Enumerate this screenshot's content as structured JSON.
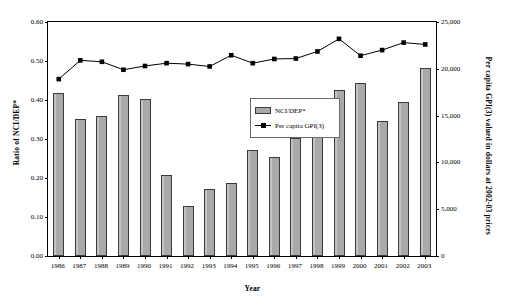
{
  "chart_data": {
    "type": "bar",
    "title": "",
    "xlabel": "Year",
    "ylabel": "Ratio of NCI/DEP*",
    "y2label": "Per capita GPI(3) valued in dollars at 2002-03 prices",
    "grid": false,
    "legend_position": "inside-center",
    "categories": [
      "1986",
      "1987",
      "1988",
      "1989",
      "1990",
      "1991",
      "1992",
      "1993",
      "1994",
      "1995",
      "1996",
      "1997",
      "1998",
      "1999",
      "2000",
      "2001",
      "2002",
      "2003"
    ],
    "ylim": [
      0.0,
      0.6
    ],
    "ytick_labels": [
      "0.00",
      "0.10",
      "0.20",
      "0.30",
      "0.40",
      "0.50",
      "0.60"
    ],
    "ytick_values": [
      0.0,
      0.1,
      0.2,
      0.3,
      0.4,
      0.5,
      0.6
    ],
    "y2lim": [
      0,
      25000
    ],
    "y2tick_labels": [
      "0",
      "5,000",
      "10,000",
      "15,000",
      "20,000",
      "25,000"
    ],
    "y2tick_values": [
      0,
      5000,
      10000,
      15000,
      20000,
      25000
    ],
    "series": [
      {
        "name": "NCI/DEP*",
        "kind": "bar",
        "axis": "left",
        "color": "#a9a9a9",
        "edge_color": "#3a3a3a",
        "values": [
          0.417,
          0.351,
          0.358,
          0.414,
          0.402,
          0.208,
          0.128,
          0.171,
          0.188,
          0.272,
          0.254,
          0.303,
          0.366,
          0.425,
          0.443,
          0.347,
          0.394,
          0.481
        ]
      },
      {
        "name": "Per capita GPI(3)",
        "kind": "line",
        "axis": "right",
        "color": "#000000",
        "marker": "square",
        "values": [
          18900,
          20900,
          20750,
          19900,
          20300,
          20600,
          20500,
          20250,
          21450,
          20600,
          21050,
          21100,
          21850,
          23200,
          21400,
          22000,
          22800,
          22600
        ]
      }
    ]
  },
  "legend": {
    "items": [
      {
        "label": "NCI/DEP*",
        "marker": "bar-swatch"
      },
      {
        "label": "Per capita GPI(3)",
        "marker": "line-square-swatch"
      }
    ]
  },
  "axes": {
    "left_title": "Ratio of NCI/DEP*",
    "right_title": "Per capita GPI(3) valued in dollars at 2002-03 prices",
    "bottom_title": "Year"
  }
}
